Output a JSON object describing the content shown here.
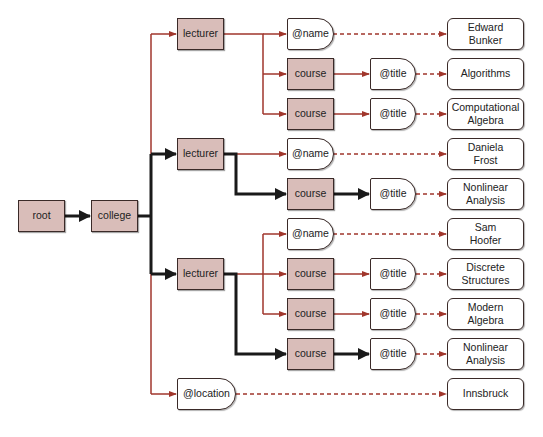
{
  "colors": {
    "element_fill": "#d9bdb9",
    "border": "#3a2a28",
    "highlight_edge": "#1a1a1a",
    "normal_edge": "#a0362c"
  },
  "nodes": {
    "root": "root",
    "college": "college",
    "lecturers": [
      {
        "label": "lecturer",
        "name_attr": "@name",
        "name_value": "Edward Bunker",
        "courses": [
          {
            "label": "course",
            "title_attr": "@title",
            "title_value": "Algorithms"
          },
          {
            "label": "course",
            "title_attr": "@title",
            "title_value": "Computational Algebra"
          }
        ]
      },
      {
        "label": "lecturer",
        "name_attr": "@name",
        "name_value": "Daniela Frost",
        "courses": [
          {
            "label": "course",
            "title_attr": "@title",
            "title_value": "Nonlinear Analysis"
          }
        ]
      },
      {
        "label": "lecturer",
        "name_attr": "@name",
        "name_value": "Sam Hoofer",
        "courses": [
          {
            "label": "course",
            "title_attr": "@title",
            "title_value": "Discrete Structures"
          },
          {
            "label": "course",
            "title_attr": "@title",
            "title_value": "Modern Algebra"
          },
          {
            "label": "course",
            "title_attr": "@title",
            "title_value": "Nonlinear Analysis"
          }
        ]
      }
    ],
    "location_attr": "@location",
    "location_value": "Innsbruck"
  }
}
